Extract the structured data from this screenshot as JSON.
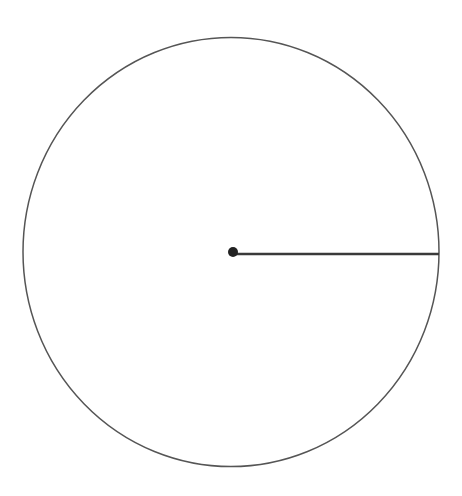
{
  "diagram": {
    "type": "circle-with-radius",
    "background": "#ffffff",
    "circle": {
      "cx": 231,
      "cy": 252,
      "rx": 208,
      "ry": 214.5,
      "stroke": "#555555",
      "stroke_width": 1.5,
      "fill": "none"
    },
    "center_point": {
      "cx": 233,
      "cy": 252,
      "r": 5,
      "fill": "#222222"
    },
    "radius_line": {
      "x1": 233,
      "y1": 254,
      "x2": 439,
      "y2": 254,
      "stroke": "#3a3a3a",
      "stroke_width": 2.5
    }
  }
}
